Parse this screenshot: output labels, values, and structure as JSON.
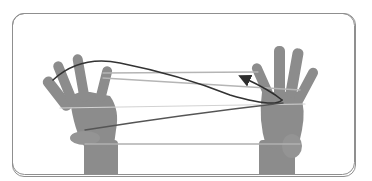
{
  "illustration": {
    "subject": "hands holding string figure with direction arrow",
    "colors": {
      "frame_border": "#8f8f8f",
      "skin": "#8a8a8a",
      "skin_shadow": "#6e6e6e",
      "string_light": "#b5b5b5",
      "string_dark": "#3a3a3a"
    }
  }
}
